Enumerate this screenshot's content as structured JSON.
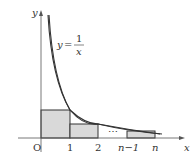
{
  "diagram": {
    "curve_label": {
      "lhs": "y",
      "eq": "=",
      "num": "1",
      "den": "x"
    },
    "axes": {
      "x_label": "x",
      "y_label": "y",
      "origin": "O"
    },
    "ticks": [
      "1",
      "2",
      "n−1",
      "n"
    ],
    "ellipsis": "⋯",
    "colors": {
      "fill": "#d9d9d9",
      "stroke": "#333333",
      "axis": "#555555"
    }
  }
}
